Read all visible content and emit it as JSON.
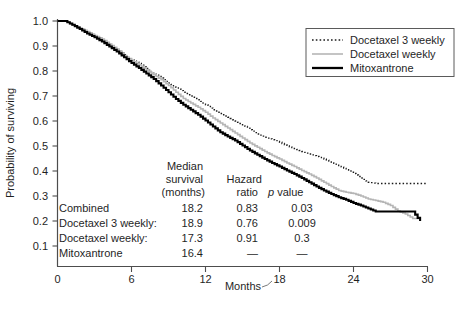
{
  "chart_data": {
    "type": "line",
    "title": "",
    "xlabel": "Months",
    "ylabel": "Probability of surviving",
    "xlim": [
      0,
      30
    ],
    "ylim": [
      0.0,
      1.0
    ],
    "xticks": [
      0,
      6,
      12,
      18,
      24,
      30
    ],
    "xtick_labels": [
      "0",
      "6",
      "12",
      "18",
      "24",
      "30"
    ],
    "yticks": [
      0.1,
      0.2,
      0.3,
      0.4,
      0.5,
      0.6,
      0.7,
      0.8,
      0.9,
      1.0
    ],
    "ytick_labels": [
      "0.1",
      "0.2",
      "0.3",
      "0.4",
      "0.5",
      "0.6",
      "0.7",
      "0.8",
      "0.9",
      "1.0"
    ],
    "grid": false,
    "legend_position": "top-right",
    "curve_style": "step",
    "series": [
      {
        "name": "Docetaxel 3 weekly",
        "color": "#1a1a1a",
        "line_style": "dotted",
        "line_width": 1.3,
        "x": [
          0,
          0.6,
          1.2,
          1.8,
          2.4,
          3.0,
          3.6,
          4.2,
          4.8,
          5.4,
          6.0,
          6.6,
          7.2,
          7.8,
          8.4,
          9.0,
          9.6,
          10.2,
          10.8,
          11.4,
          12.0,
          12.6,
          13.2,
          13.8,
          14.4,
          15.0,
          15.6,
          16.2,
          16.8,
          17.4,
          18.0,
          18.6,
          19.2,
          19.8,
          20.4,
          21.0,
          21.6,
          22.2,
          22.8,
          23.4,
          24.0,
          24.6,
          25.2,
          25.8,
          26.4,
          27.0,
          27.6,
          28.2,
          28.8,
          29.4,
          30.0
        ],
        "y": [
          1.0,
          1.0,
          0.985,
          0.97,
          0.955,
          0.94,
          0.925,
          0.905,
          0.885,
          0.865,
          0.845,
          0.83,
          0.81,
          0.79,
          0.772,
          0.752,
          0.735,
          0.715,
          0.7,
          0.685,
          0.665,
          0.645,
          0.63,
          0.615,
          0.6,
          0.585,
          0.565,
          0.548,
          0.535,
          0.525,
          0.515,
          0.5,
          0.49,
          0.478,
          0.468,
          0.458,
          0.448,
          0.435,
          0.422,
          0.405,
          0.39,
          0.372,
          0.355,
          0.35,
          0.35,
          0.35,
          0.35,
          0.35,
          0.35,
          0.35,
          0.35
        ]
      },
      {
        "name": "Docetaxel weekly",
        "color": "#b5b5b5",
        "line_style": "solid",
        "line_width": 1.6,
        "x": [
          0,
          0.6,
          1.2,
          1.8,
          2.4,
          3.0,
          3.6,
          4.2,
          4.8,
          5.4,
          6.0,
          6.6,
          7.2,
          7.8,
          8.4,
          9.0,
          9.6,
          10.2,
          10.8,
          11.4,
          12.0,
          12.6,
          13.2,
          13.8,
          14.4,
          15.0,
          15.6,
          16.2,
          16.8,
          17.4,
          18.0,
          18.6,
          19.2,
          19.8,
          20.4,
          21.0,
          21.6,
          22.2,
          22.8,
          23.4,
          24.0,
          24.6,
          25.2,
          25.8,
          26.4,
          27.0,
          27.6,
          28.2,
          28.8,
          29.4
        ],
        "y": [
          1.0,
          1.0,
          0.985,
          0.972,
          0.958,
          0.942,
          0.928,
          0.908,
          0.888,
          0.862,
          0.843,
          0.825,
          0.805,
          0.785,
          0.765,
          0.742,
          0.715,
          0.69,
          0.672,
          0.655,
          0.635,
          0.612,
          0.592,
          0.572,
          0.552,
          0.532,
          0.512,
          0.495,
          0.478,
          0.462,
          0.448,
          0.432,
          0.418,
          0.402,
          0.388,
          0.372,
          0.355,
          0.338,
          0.322,
          0.315,
          0.31,
          0.3,
          0.288,
          0.282,
          0.275,
          0.262,
          0.24,
          0.228,
          0.21,
          0.21
        ]
      },
      {
        "name": "Mitoxantrone",
        "color": "#000000",
        "line_style": "solid",
        "line_width": 2.1,
        "x": [
          0,
          0.6,
          1.2,
          1.8,
          2.4,
          3.0,
          3.6,
          4.2,
          4.8,
          5.4,
          6.0,
          6.6,
          7.2,
          7.8,
          8.4,
          9.0,
          9.6,
          10.2,
          10.8,
          11.4,
          12.0,
          12.6,
          13.2,
          13.8,
          14.4,
          15.0,
          15.6,
          16.2,
          16.8,
          17.4,
          18.0,
          18.6,
          19.2,
          19.8,
          20.4,
          21.0,
          21.6,
          22.2,
          22.8,
          23.4,
          24.0,
          24.6,
          25.2,
          25.8,
          26.4,
          27.0,
          27.6,
          28.2,
          28.8,
          29.4
        ],
        "y": [
          1.0,
          1.0,
          0.985,
          0.968,
          0.95,
          0.935,
          0.918,
          0.898,
          0.878,
          0.855,
          0.832,
          0.812,
          0.79,
          0.768,
          0.742,
          0.715,
          0.688,
          0.665,
          0.645,
          0.625,
          0.602,
          0.578,
          0.555,
          0.538,
          0.522,
          0.502,
          0.482,
          0.465,
          0.448,
          0.432,
          0.418,
          0.402,
          0.388,
          0.372,
          0.355,
          0.338,
          0.322,
          0.308,
          0.295,
          0.285,
          0.272,
          0.262,
          0.25,
          0.238,
          0.238,
          0.238,
          0.238,
          0.238,
          0.238,
          0.2
        ]
      }
    ],
    "annotations": {
      "stats_table": {
        "headers": {
          "col0": "",
          "col1_line1": "Median",
          "col1_line2": "survival",
          "col1_line3": "(months)",
          "col2_line1": "Hazard",
          "col2_line2": "ratio",
          "col3_italic": "p",
          "col3_rest": " value"
        },
        "rows": [
          {
            "label": "Combined",
            "median": "18.2",
            "hazard": "0.83",
            "p": "0.03"
          },
          {
            "label": "Docetaxel 3 weekly:",
            "median": "18.9",
            "hazard": "0.76",
            "p": "0.009"
          },
          {
            "label": "Docetaxel weekly:",
            "median": "17.3",
            "hazard": "0.91",
            "p": "0.3"
          },
          {
            "label": "Mitoxantrone",
            "median": "16.4",
            "hazard": "—",
            "p": "—"
          }
        ]
      }
    }
  },
  "legend": {
    "items": [
      {
        "label": "Docetaxel 3 weekly",
        "style": "dotted",
        "color": "#1a1a1a"
      },
      {
        "label": "Docetaxel weekly",
        "style": "solid-gray",
        "color": "#b5b5b5"
      },
      {
        "label": "Mitoxantrone",
        "style": "solid-bold",
        "color": "#000000"
      }
    ],
    "border_color": "#5a5a5a"
  },
  "colors": {
    "axis": "#4d4d4d",
    "text": "#1f1f1f",
    "background": "#ffffff"
  }
}
